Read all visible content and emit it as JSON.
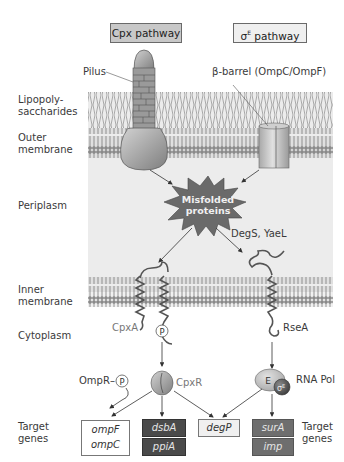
{
  "header": {
    "cpx_pathway": "Cpx pathway",
    "sigma_pathway_symbol": "σ",
    "sigma_pathway_superscript": "E",
    "sigma_pathway_label": " pathway"
  },
  "compartments": {
    "lps_line1": "Lipopoly-",
    "lps_line2": "saccharides",
    "outer_line1": "Outer",
    "outer_line2": "membrane",
    "periplasm": "Periplasm",
    "inner_line1": "Inner",
    "inner_line2": "membrane",
    "cytoplasm": "Cytoplasm",
    "target_left_line1": "Target",
    "target_left_line2": "genes",
    "target_right_line1": "Target",
    "target_right_line2": "genes"
  },
  "structures": {
    "pilus": "Pilus",
    "beta_barrel": "β-barrel (OmpC/OmpF)",
    "misfolded_line1": "Misfolded",
    "misfolded_line2": "proteins",
    "proteases": "DegS, YaeL",
    "cpxa": "CpxA",
    "phospho": "P",
    "rsea": "RseA",
    "cpxr": "CpxR",
    "ompr": "OmpR–",
    "ompr_phospho": "P",
    "rna_pol": "RNA Pol",
    "core_enzyme": "E",
    "sigma_factor": "σ",
    "sigma_factor_sup": "E"
  },
  "genes": {
    "ompF": "ompF",
    "ompC": "ompC",
    "dsbA": "dsbA",
    "ppiA": "ppiA",
    "degP": "degP",
    "surA": "surA",
    "imp": "imp"
  },
  "colors": {
    "periplasm_bg": "#ececec",
    "cpx_box": "#c8c8c8",
    "sigma_box": "#efefef",
    "gene_dark": "#4a4a4a",
    "gene_mid": "#6e6e6e",
    "starburst": "#6a6a6a",
    "sigma_factor": "#5a5a5a"
  }
}
